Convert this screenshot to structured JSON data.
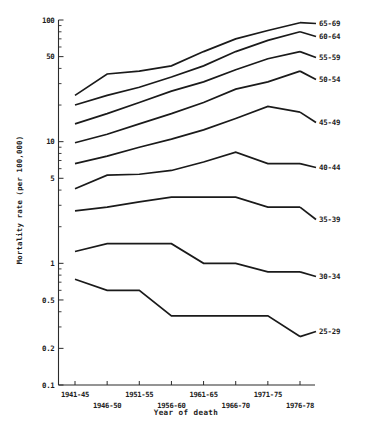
{
  "figure": {
    "title_caption": "",
    "axis": {
      "xlabel": "Year of death",
      "ylabel": "Mortality rate (per 100,000)"
    }
  },
  "chart_data": {
    "type": "line",
    "title": "",
    "xlabel": "Year of death",
    "ylabel": "Mortality rate (per 100,000)",
    "yscale": "log",
    "ylim": [
      0.1,
      100
    ],
    "grid": false,
    "legend_position": "right-inline-labels",
    "ytick_labels": [
      "100",
      "50",
      "10",
      "5",
      "1",
      "0.5",
      "0.2",
      "0.1"
    ],
    "ytick_values": [
      100,
      50,
      10,
      5,
      1,
      0.5,
      0.2,
      0.1
    ],
    "categories": [
      "1941-45",
      "1946-50",
      "1951-55",
      "1956-60",
      "1961-65",
      "1966-70",
      "1971-75",
      "1976-78"
    ],
    "xtick_labels_top_row": [
      "1941-45",
      "1951-55",
      "1961-65",
      "1971-75"
    ],
    "xtick_labels_bottom_row": [
      "1946-50",
      "1956-60",
      "1966-70",
      "1976-78"
    ],
    "series": [
      {
        "name": "65-69",
        "values": [
          24,
          36,
          38,
          42,
          55,
          70,
          82,
          95
        ]
      },
      {
        "name": "60-64",
        "values": [
          20,
          24,
          28,
          34,
          42,
          55,
          68,
          80
        ]
      },
      {
        "name": "55-59",
        "values": [
          14,
          17,
          21,
          26,
          31,
          39,
          48,
          55
        ]
      },
      {
        "name": "50-54",
        "values": [
          9.8,
          11.5,
          14,
          17,
          21,
          27,
          31,
          38
        ]
      },
      {
        "name": "45-49",
        "values": [
          6.6,
          7.6,
          9.0,
          10.5,
          12.5,
          15.5,
          19.5,
          17.5
        ]
      },
      {
        "name": "40-44",
        "values": [
          4.1,
          5.3,
          5.4,
          5.8,
          6.8,
          8.2,
          6.6,
          6.6
        ]
      },
      {
        "name": "35-39",
        "values": [
          2.7,
          2.9,
          3.2,
          3.5,
          3.5,
          3.5,
          2.9,
          2.9
        ]
      },
      {
        "name": "30-34",
        "values": [
          1.25,
          1.45,
          1.45,
          1.45,
          1.0,
          1.0,
          0.85,
          0.85
        ]
      },
      {
        "name": "25-29",
        "values": [
          0.74,
          0.6,
          0.6,
          0.37,
          0.37,
          0.37,
          0.37,
          0.25
        ]
      }
    ]
  }
}
